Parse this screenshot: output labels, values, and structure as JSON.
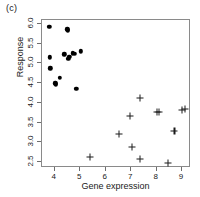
{
  "figure": {
    "panel_label": "(c)",
    "background": "#ffffff",
    "axis_color": "#8a8a8a"
  },
  "chart_data": {
    "type": "scatter",
    "title": "(c)",
    "xlabel": "Gene expression",
    "ylabel": "Response",
    "xlim": [
      3.5,
      9.35
    ],
    "ylim": [
      2.35,
      6.1
    ],
    "xticks": [
      4,
      5,
      6,
      7,
      8,
      9
    ],
    "xticklabels": [
      "4",
      "5",
      "6",
      "7",
      "8",
      "9"
    ],
    "yticks": [
      2.5,
      3.0,
      3.5,
      4.0,
      4.5,
      5.0,
      5.5,
      6.0
    ],
    "yticklabels": [
      "2.5",
      "3.0",
      "3.5",
      "4.0",
      "4.5",
      "5.0",
      "5.5",
      "6.0"
    ],
    "grid": false,
    "legend": null,
    "series": [
      {
        "name": "group-filled-circle",
        "marker": "filled-circle",
        "color": "#000000",
        "x": [
          3.78,
          3.8,
          3.82,
          4.02,
          4.05,
          4.21,
          4.37,
          4.49,
          4.52,
          4.53,
          4.57,
          4.72,
          4.78,
          4.84,
          5.02
        ],
        "y": [
          5.92,
          5.15,
          4.88,
          4.5,
          4.47,
          4.64,
          5.23,
          5.86,
          5.84,
          5.12,
          5.17,
          5.26,
          5.24,
          4.35,
          5.31
        ]
      },
      {
        "name": "group-plus",
        "marker": "plus",
        "color": "#1a1a1a",
        "x": [
          5.38,
          6.52,
          6.97,
          7.02,
          7.33,
          7.35,
          8.02,
          8.1,
          8.46,
          8.7,
          9.0,
          9.1
        ],
        "y": [
          2.62,
          3.21,
          3.67,
          2.88,
          4.13,
          2.57,
          3.76,
          3.76,
          2.48,
          3.3,
          3.82,
          3.85
        ]
      }
    ]
  }
}
